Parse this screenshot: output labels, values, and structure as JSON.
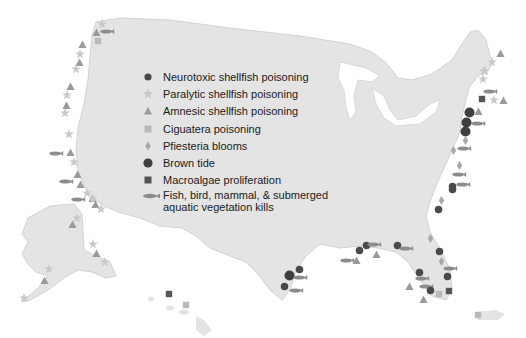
{
  "colors": {
    "land": "#e4e4e4",
    "land_edge": "#d2d2d2",
    "water": "#ffffff",
    "neurotoxic": "#5a5a5a",
    "paralytic": "#c9c9c9",
    "amnesic": "#9a9a9a",
    "ciguatera": "#b9b9b9",
    "pfiesteria": "#a8a8a8",
    "brown_tide": "#3f3f3f",
    "macroalgae": "#555555",
    "kills": "#8c8c8c"
  },
  "legend": {
    "items": [
      {
        "icon": "circle-small",
        "label": "Neurotoxic shellfish poisoning"
      },
      {
        "icon": "star",
        "label": "Paralytic shellfish poisoning"
      },
      {
        "icon": "triangle",
        "label": "Amnesic shellfish poisoning"
      },
      {
        "icon": "square-light",
        "label": "Ciguatera poisoning"
      },
      {
        "icon": "diamond",
        "label": "Pfiesteria blooms"
      },
      {
        "icon": "circle-large",
        "label": "Brown tide"
      },
      {
        "icon": "square-dark",
        "label": "Macroalgae proliferation"
      },
      {
        "icon": "fish",
        "label_line1": "Fish, bird, mammal, & submerged",
        "label_line2": "aquatic vegetation kills"
      }
    ]
  },
  "regions": [
    "Contiguous United States",
    "Alaska",
    "Hawaii",
    "Puerto Rico"
  ]
}
